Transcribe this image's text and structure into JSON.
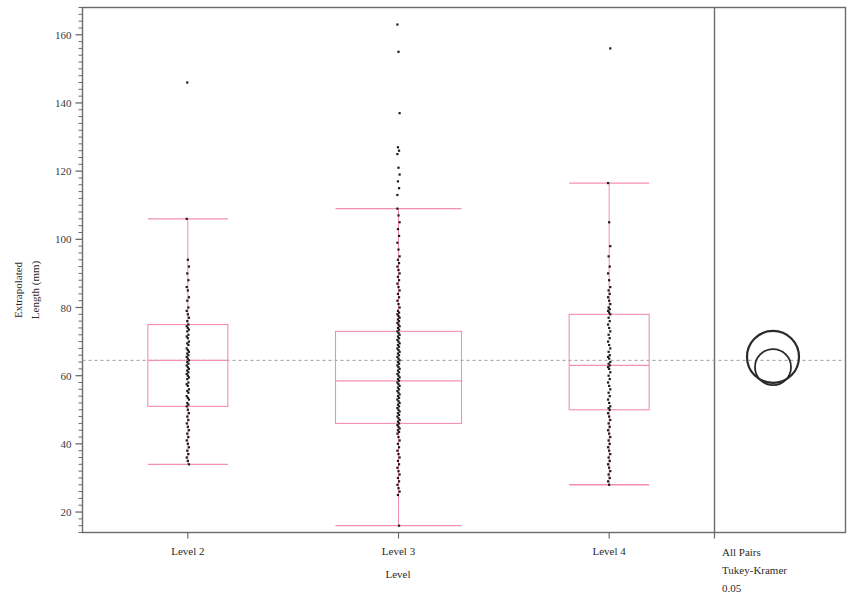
{
  "chart_data": {
    "type": "box",
    "title": "",
    "xlabel": "Level",
    "ylabel": "Extrapolated Length (mm)",
    "ylabel_line1": "Extrapolated",
    "ylabel_line2": "Length (mm)",
    "categories": [
      "Level 2",
      "Level 3",
      "Level 4"
    ],
    "ylim": [
      14,
      168
    ],
    "ytick_values": [
      20,
      40,
      60,
      80,
      100,
      120,
      140,
      160
    ],
    "ytick_labels": [
      "20",
      "40",
      "60",
      "80",
      "100",
      "120",
      "140",
      "160"
    ],
    "minor_tick_step": 2,
    "grid": false,
    "grand_mean": 64.5,
    "grand_mean_style": "dashed",
    "box_color": "#f48fb1",
    "point_color": "#1a1a1a",
    "frame_color": "#6b6b6b",
    "legend": "",
    "series": [
      {
        "name": "Level 2",
        "min_whisker": 34,
        "q1": 51,
        "median": 64.5,
        "q3": 75,
        "max_whisker": 106,
        "outliers": [
          146
        ],
        "points": [
          106,
          94,
          92,
          90,
          88,
          86,
          85,
          83,
          82,
          80,
          79,
          78,
          77,
          76,
          75,
          74.5,
          74,
          73.5,
          73,
          72,
          71.5,
          71,
          70,
          69.5,
          69,
          68,
          67.5,
          67,
          66.5,
          66,
          65.5,
          65,
          64.5,
          64,
          63.5,
          63,
          62.5,
          62,
          61.5,
          61,
          60.5,
          60,
          59.5,
          59,
          58,
          57.5,
          57,
          56,
          55.5,
          55,
          54,
          53.5,
          53,
          52,
          51.5,
          51,
          50,
          49,
          48,
          47,
          46,
          45,
          44,
          43,
          42,
          41,
          40,
          39,
          38,
          37,
          36,
          35,
          34
        ]
      },
      {
        "name": "Level 3",
        "min_whisker": 16,
        "q1": 46,
        "median": 58.5,
        "q3": 73,
        "max_whisker": 109,
        "outliers": [
          163,
          155,
          137,
          127,
          126,
          125,
          121,
          119,
          117,
          115,
          113
        ],
        "points": [
          109,
          107,
          105,
          103,
          101,
          99,
          97,
          95,
          94,
          93,
          92,
          91,
          90,
          89,
          88,
          87,
          86,
          85,
          84,
          83,
          82,
          81,
          80,
          79,
          78.5,
          78,
          77.5,
          77,
          76.5,
          76,
          75.5,
          75,
          74.5,
          74,
          73.5,
          73,
          72.5,
          72,
          71.5,
          71,
          70.5,
          70,
          69.5,
          69,
          68.5,
          68,
          67.5,
          67,
          66.5,
          66,
          65.5,
          65,
          64.5,
          64,
          63.5,
          63,
          62.5,
          62,
          61.5,
          61,
          60.5,
          60,
          59.5,
          59,
          58.5,
          58,
          57.5,
          57,
          56.5,
          56,
          55.5,
          55,
          54.5,
          54,
          53.5,
          53,
          52.5,
          52,
          51.5,
          51,
          50.5,
          50,
          49.5,
          49,
          48.5,
          48,
          47.5,
          47,
          46.5,
          46,
          45.5,
          45,
          44.5,
          44,
          43.5,
          43,
          42,
          41,
          40,
          39,
          38,
          37,
          36,
          35,
          34,
          33,
          32,
          31,
          30,
          29,
          28,
          27,
          26,
          25,
          16
        ]
      },
      {
        "name": "Level 4",
        "min_whisker": 28,
        "q1": 50,
        "median": 63,
        "q3": 78,
        "max_whisker": 116.5,
        "outliers": [
          156
        ],
        "points": [
          116.5,
          105,
          98,
          95,
          92,
          90,
          88,
          86,
          85,
          84,
          83,
          82,
          81,
          80,
          79.5,
          79,
          78.5,
          78,
          77,
          76,
          75,
          74,
          73,
          72,
          71,
          70,
          69,
          68,
          67,
          66,
          65.5,
          65,
          64,
          63.5,
          63,
          62.5,
          62,
          61,
          60,
          59,
          58,
          57,
          56,
          55,
          54,
          53,
          52,
          51,
          50.5,
          50,
          49,
          48,
          47,
          46,
          45,
          44,
          43,
          42,
          41,
          40,
          39,
          38,
          37,
          36,
          35,
          34,
          33,
          32,
          31,
          30,
          29,
          28
        ]
      }
    ]
  },
  "comparison_panel": {
    "line1": "All Pairs",
    "line2": "Tukey-Kramer",
    "line3": "0.05",
    "circles": [
      {
        "name": "circle-outer",
        "center": 65.5,
        "radius_px": 26
      },
      {
        "name": "circle-inner",
        "center": 62.5,
        "radius_px": 18
      }
    ]
  }
}
